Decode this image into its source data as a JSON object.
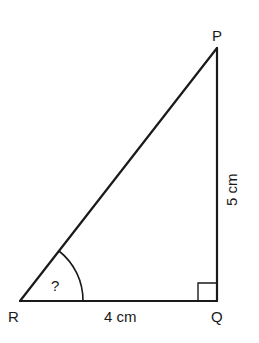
{
  "diagram": {
    "type": "right-triangle",
    "vertices": {
      "P": {
        "label": "P",
        "x": 217,
        "y": 48
      },
      "Q": {
        "label": "Q",
        "x": 217,
        "y": 301
      },
      "R": {
        "label": "R",
        "x": 20,
        "y": 301
      }
    },
    "sides": {
      "RQ": {
        "label": "4 cm"
      },
      "QP": {
        "label": "5 cm"
      }
    },
    "angle_R": {
      "label": "?"
    },
    "right_angle_at": "Q",
    "stroke_color": "#1a1a1a"
  }
}
